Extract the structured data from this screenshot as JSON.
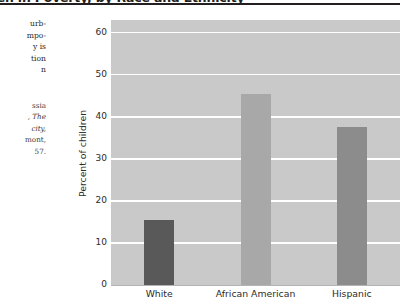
{
  "figure": {
    "title": "dren in Poverty, by Race and Ethnicity",
    "title_note": "heading clipped at top and left of page"
  },
  "margin_note": {
    "lines": [
      "urb-",
      "mpo-",
      "y is",
      "tion",
      "n"
    ]
  },
  "margin_source": {
    "lines": [
      "ssia",
      ", The",
      "city,",
      "mont,",
      "57."
    ]
  },
  "chart_data": {
    "type": "bar",
    "title": "dren in Poverty, by Race and Ethnicity",
    "xlabel": "",
    "ylabel": "Percent of children",
    "categories": [
      "White",
      "African American",
      "Hispanic"
    ],
    "values": [
      15.5,
      45.5,
      37.5
    ],
    "bar_colors": [
      "#595959",
      "#a8a8a8",
      "#8c8c8c"
    ],
    "ylim": [
      0,
      63
    ],
    "yticks": [
      0,
      10,
      20,
      30,
      40,
      50,
      60
    ],
    "ytick_labels": [
      "0",
      "10",
      "20",
      "30",
      "40",
      "50",
      "60"
    ],
    "grid": "horizontal-white-on-gray",
    "legend": "none",
    "plot_background": "#c9c9c9",
    "gridline_color": "#ffffff"
  }
}
